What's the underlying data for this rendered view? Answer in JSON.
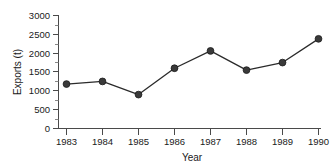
{
  "chart_data": {
    "type": "line",
    "title": "",
    "xlabel": "Year",
    "ylabel": "Exports (t)",
    "categories": [
      "1983",
      "1984",
      "1985",
      "1986",
      "1987",
      "1988",
      "1989",
      "1990"
    ],
    "x": [
      1983,
      1984,
      1985,
      1986,
      1987,
      1988,
      1989,
      1990
    ],
    "values": [
      1180,
      1250,
      900,
      1600,
      2060,
      1550,
      1750,
      2380
    ],
    "series": [
      {
        "name": "Exports",
        "values": [
          1180,
          1250,
          900,
          1600,
          2060,
          1550,
          1750,
          2380
        ]
      }
    ],
    "ylim": [
      0,
      3000
    ],
    "xlim": [
      1983,
      1990
    ],
    "yticks": [
      0,
      500,
      1000,
      1500,
      2000,
      2500,
      3000
    ],
    "ytick_labels": [
      "0",
      "500",
      "1000",
      "1500",
      "2000",
      "2500",
      "3000"
    ],
    "xtick_labels": [
      "1983",
      "1984",
      "1985",
      "1986",
      "1987",
      "1988",
      "1989",
      "1990"
    ],
    "grid": false,
    "legend": null,
    "marker": "filled-circle",
    "line_color": "#2b2b2b",
    "marker_color": "#3a3a3a",
    "axis_color": "#4a4a4a",
    "background_color": "#ffffff"
  }
}
